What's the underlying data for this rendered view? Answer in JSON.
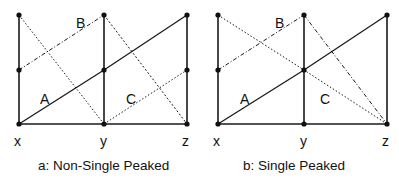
{
  "panels": [
    {
      "id": "a",
      "caption": "a: Non-Single Peaked",
      "axis_labels": [
        "x",
        "y",
        "z"
      ],
      "curve_labels": {
        "A": "A",
        "B": "B",
        "C": "C"
      },
      "type": "non-single-peaked"
    },
    {
      "id": "b",
      "caption": "b: Single Peaked",
      "axis_labels": [
        "x",
        "y",
        "z"
      ],
      "curve_labels": {
        "A": "A",
        "B": "B",
        "C": "C"
      },
      "type": "single-peaked"
    }
  ],
  "colors": {
    "line": "#1a1a1a",
    "dot": "#111111"
  }
}
